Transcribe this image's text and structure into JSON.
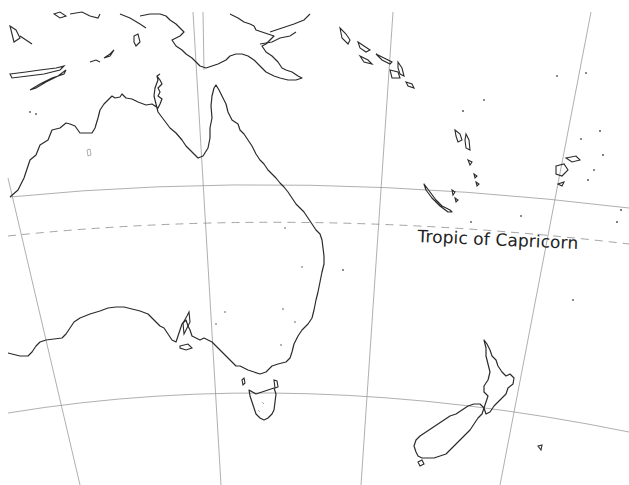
{
  "map": {
    "title": "",
    "region": "Australia and Oceania outline map",
    "labels": {
      "tropic": "Tropic of Capricorn"
    },
    "colors": {
      "background": "#ffffff",
      "coastline": "#2b2b2b",
      "graticule": "#9a9a9a"
    },
    "features": [
      "australia-mainland",
      "tasmania",
      "new-zealand-north-island",
      "new-zealand-south-island",
      "new-guinea",
      "solomon-islands",
      "vanuatu",
      "new-caledonia",
      "fiji",
      "indonesia-islands"
    ]
  }
}
